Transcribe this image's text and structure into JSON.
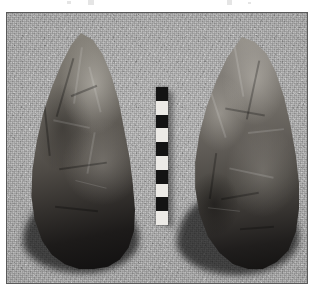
{
  "page": {
    "width_px": 319,
    "height_px": 295,
    "background_color": "#ffffff",
    "content_type": "photographic-plate"
  },
  "scan_artifacts": [
    {
      "name": "artifact-mark-1",
      "left_px": 67,
      "top_px": 1,
      "width_px": 4,
      "height_px": 3
    },
    {
      "name": "artifact-mark-2",
      "left_px": 88,
      "top_px": 0,
      "width_px": 6,
      "height_px": 5
    },
    {
      "name": "artifact-mark-3",
      "left_px": 227,
      "top_px": 0,
      "width_px": 5,
      "height_px": 5
    },
    {
      "name": "artifact-mark-4",
      "left_px": 248,
      "top_px": 2,
      "width_px": 3,
      "height_px": 2
    }
  ],
  "photo": {
    "frame_border_color": "#5a5a5a",
    "frame_border_width_px": 1,
    "background_color": "#a8a8a8",
    "background_description": "grainy mid-grey granular surface",
    "left_px": 6,
    "top_px": 12,
    "width_px": 302,
    "height_px": 272,
    "subject": "two stone bifaces (hand axes) photographed side by side with a central scale bar"
  },
  "artifacts": [
    {
      "id": "biface-left",
      "label": "left-hand-axe",
      "description": "pointed biface, tapering tip at top, broad rounded butt at bottom, lower half in deep shadow",
      "highlight_color": "#8e8a82",
      "shadow_color": "#111010",
      "left_px": 20,
      "top_px": 20,
      "width_px": 108,
      "height_px": 236
    },
    {
      "id": "biface-right",
      "label": "right-hand-axe",
      "description": "pointed biface, asymmetric tip leaning left, broad rounded base, strong cast shadow to the lower-left",
      "highlight_color": "#9a968e",
      "shadow_color": "#141312",
      "left_px": 186,
      "top_px": 24,
      "width_px": 106,
      "height_px": 232
    }
  ],
  "scale_bar": {
    "label": "photographic scale bar",
    "orientation": "vertical",
    "left_px": 149,
    "top_px": 74,
    "width_px": 12,
    "height_px": 138,
    "segment_count": 10,
    "first_segment_color": "dark",
    "dark_color": "#141414",
    "light_color": "#eceae6",
    "segments": [
      "dark",
      "light",
      "dark",
      "light",
      "dark",
      "light",
      "dark",
      "light",
      "dark",
      "light"
    ]
  }
}
